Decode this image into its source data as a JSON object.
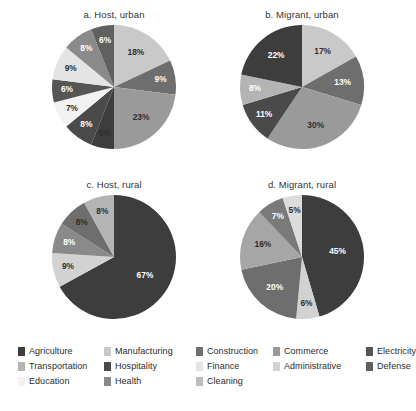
{
  "figure": {
    "background": "#ffffff",
    "width": 413,
    "height": 411
  },
  "palette": {
    "Agriculture": "#3d3d3d",
    "Manufacturing": "#c9c9c9",
    "Construction": "#6e6e6e",
    "Commerce": "#9a9a9a",
    "Electricity": "#555555",
    "Transportation": "#b4b4b4",
    "Hospitality": "#4a4a4a",
    "Finance": "#e4e4e4",
    "Administrative": "#d2d2d2",
    "Defense": "#606060",
    "Education": "#f2f2f2",
    "Health": "#8a8a8a",
    "Cleaning": "#bdbdbd"
  },
  "legend": {
    "position": "bottom",
    "columns": 5,
    "rows": 3,
    "items": [
      {
        "label": "Agriculture",
        "color": "#3d3d3d",
        "row": 0,
        "col": 0
      },
      {
        "label": "Manufacturing",
        "color": "#c9c9c9",
        "row": 0,
        "col": 1
      },
      {
        "label": "Construction",
        "color": "#6e6e6e",
        "row": 0,
        "col": 2
      },
      {
        "label": "Commerce",
        "color": "#9a9a9a",
        "row": 0,
        "col": 3
      },
      {
        "label": "Electricity",
        "color": "#555555",
        "row": 0,
        "col": 4
      },
      {
        "label": "Transportation",
        "color": "#b4b4b4",
        "row": 1,
        "col": 0
      },
      {
        "label": "Hospitality",
        "color": "#4a4a4a",
        "row": 1,
        "col": 1
      },
      {
        "label": "Finance",
        "color": "#e4e4e4",
        "row": 1,
        "col": 2
      },
      {
        "label": "Administrative",
        "color": "#d2d2d2",
        "row": 1,
        "col": 3
      },
      {
        "label": "Defense",
        "color": "#606060",
        "row": 1,
        "col": 4
      },
      {
        "label": "Education",
        "color": "#f2f2f2",
        "row": 2,
        "col": 0
      },
      {
        "label": "Health",
        "color": "#8a8a8a",
        "row": 2,
        "col": 1
      },
      {
        "label": "Cleaning",
        "color": "#bdbdbd",
        "row": 2,
        "col": 2
      }
    ]
  },
  "chart_data": [
    {
      "id": "a",
      "type": "pie",
      "title": "a. Host, urban",
      "xlabel": "",
      "ylabel": "",
      "start_angle_deg": 0,
      "direction": "clockwise",
      "categories": [
        "Manufacturing",
        "Construction",
        "Commerce",
        "Agriculture",
        "Hospitality",
        "Education",
        "Electricity",
        "Finance",
        "Health",
        "Defense",
        "Transportation"
      ],
      "values": [
        18,
        9,
        23,
        6,
        8,
        7,
        6,
        9,
        8,
        6,
        0
      ],
      "labels": [
        "18%",
        "9%",
        "23%",
        "6%",
        "8%",
        "7%",
        "6%",
        "9%",
        "8%",
        "6%",
        ""
      ],
      "colors": [
        "#c9c9c9",
        "#6e6e6e",
        "#9a9a9a",
        "#3d3d3d",
        "#4a4a4a",
        "#f2f2f2",
        "#555555",
        "#e4e4e4",
        "#8a8a8a",
        "#606060",
        "#b4b4b4"
      ],
      "label_text_colors": [
        "dark",
        "light",
        "dark",
        "dark",
        "light",
        "dark",
        "light",
        "dark",
        "light",
        "light",
        "dark"
      ]
    },
    {
      "id": "b",
      "type": "pie",
      "title": "b. Migrant, urban",
      "xlabel": "",
      "ylabel": "",
      "start_angle_deg": 0,
      "direction": "clockwise",
      "categories": [
        "Manufacturing",
        "Construction",
        "Commerce",
        "Hospitality",
        "Transportation",
        "Agriculture"
      ],
      "values": [
        17,
        13,
        30,
        11,
        8,
        22
      ],
      "labels": [
        "17%",
        "13%",
        "30%",
        "11%",
        "8%",
        "22%"
      ],
      "colors": [
        "#c9c9c9",
        "#6e6e6e",
        "#9a9a9a",
        "#4a4a4a",
        "#b4b4b4",
        "#3d3d3d"
      ],
      "label_text_colors": [
        "dark",
        "light",
        "dark",
        "light",
        "light",
        "light"
      ]
    },
    {
      "id": "c",
      "type": "pie",
      "title": "c. Host, rural",
      "xlabel": "",
      "ylabel": "",
      "start_angle_deg": 0,
      "direction": "clockwise",
      "categories": [
        "Agriculture",
        "Manufacturing",
        "Commerce",
        "Construction",
        "Transportation"
      ],
      "values": [
        67,
        9,
        8,
        8,
        8
      ],
      "labels": [
        "67%",
        "9%",
        "8%",
        "8%",
        "8%"
      ],
      "colors": [
        "#3d3d3d",
        "#d2d2d2",
        "#8a8a8a",
        "#6e6e6e",
        "#b4b4b4"
      ],
      "label_text_colors": [
        "light",
        "dark",
        "light",
        "dark",
        "dark"
      ]
    },
    {
      "id": "d",
      "type": "pie",
      "title": "d. Migrant, rural",
      "xlabel": "",
      "ylabel": "",
      "start_angle_deg": 0,
      "direction": "clockwise",
      "categories": [
        "Agriculture",
        "Manufacturing",
        "Construction",
        "Commerce",
        "Hospitality",
        "Transportation"
      ],
      "values": [
        45,
        6,
        20,
        16,
        7,
        5
      ],
      "labels": [
        "45%",
        "6%",
        "20%",
        "16%",
        "7%",
        "5%"
      ],
      "colors": [
        "#3d3d3d",
        "#d2d2d2",
        "#6e6e6e",
        "#a6a6a6",
        "#7a7a7a",
        "#dcdcdc"
      ],
      "label_text_colors": [
        "light",
        "dark",
        "light",
        "dark",
        "light",
        "dark"
      ]
    }
  ]
}
